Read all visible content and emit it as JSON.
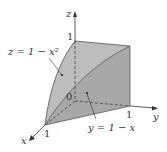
{
  "diagram": {
    "type": "3d-solid-region",
    "axes": {
      "x": {
        "label": "x",
        "tick": "1"
      },
      "y": {
        "label": "y",
        "tick": "1"
      },
      "z": {
        "label": "z",
        "tick": "1"
      },
      "origin": "0"
    },
    "surfaces": [
      {
        "name": "parabolic-cylinder",
        "label": "z = 1 − x²",
        "color": "#bdbdbd"
      },
      {
        "name": "plane",
        "label": "y = 1 − x",
        "color": "#a8a8a8"
      }
    ],
    "colors": {
      "side_face": "#cfcfcf",
      "top_face": "#bdbdbd",
      "front_face": "#a8a8a8",
      "lines": "#333333"
    }
  }
}
